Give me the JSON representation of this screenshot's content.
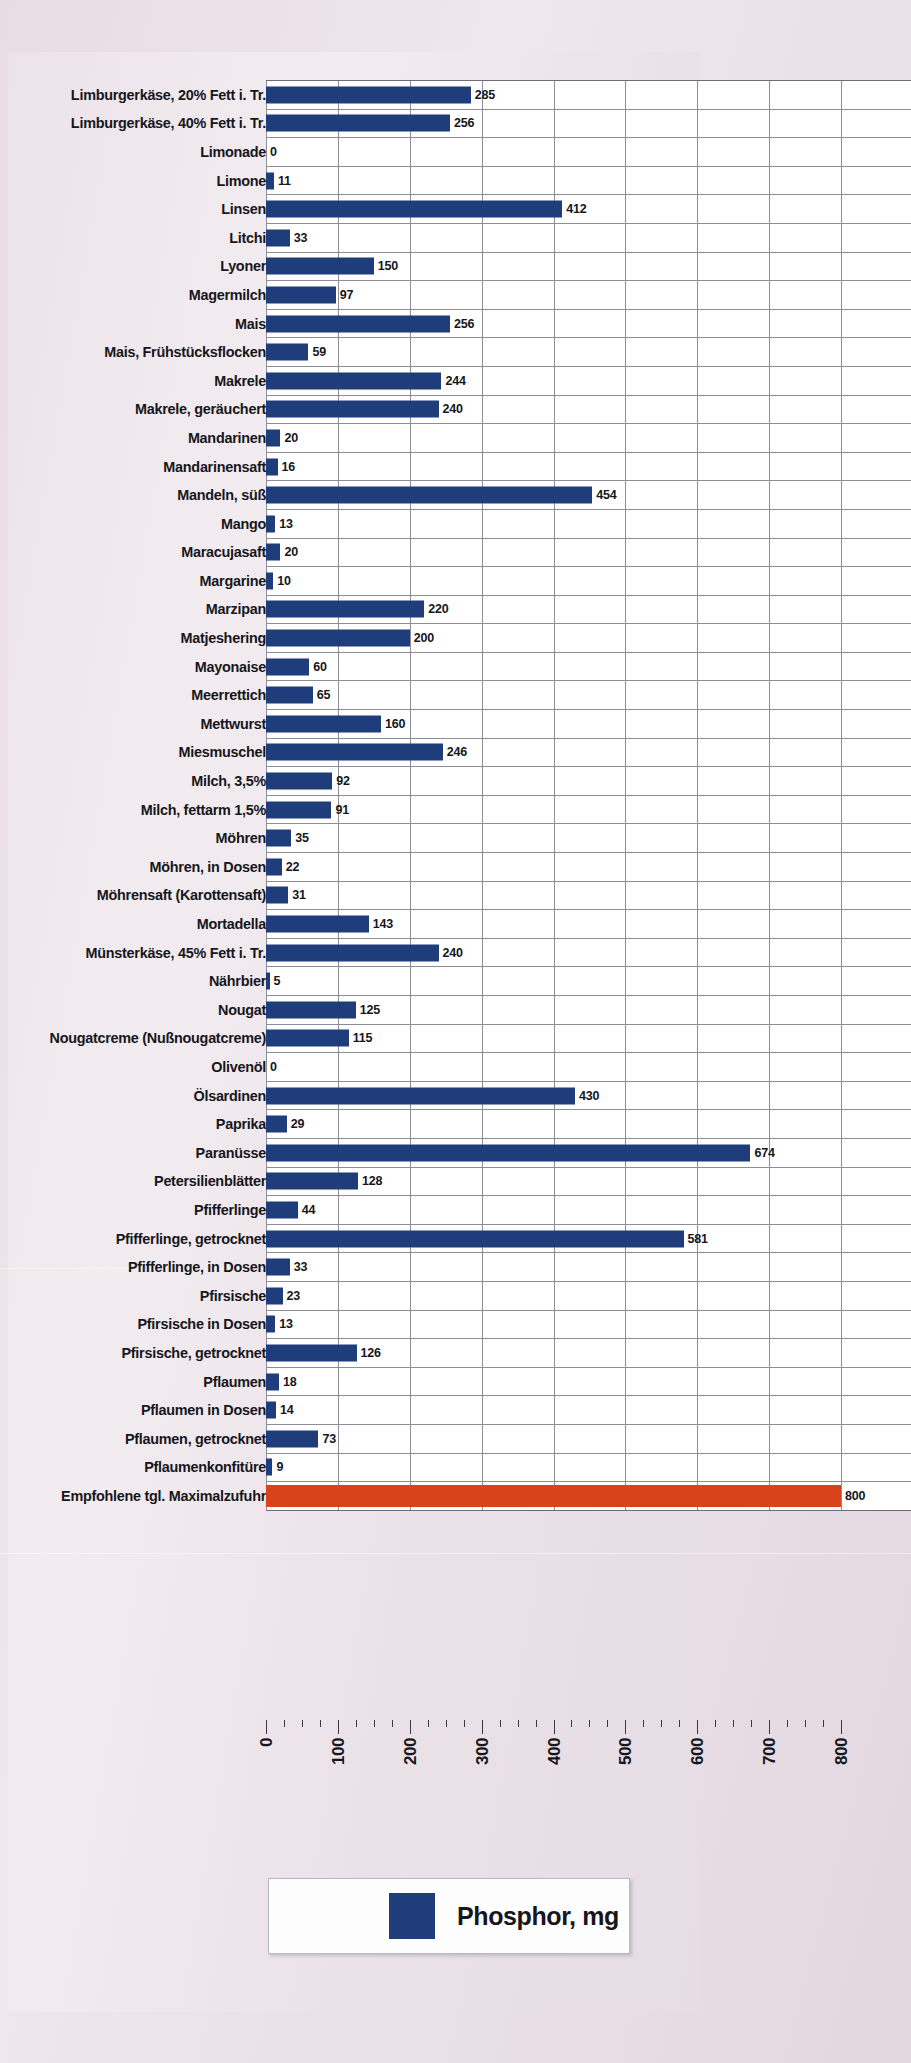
{
  "chart_data": {
    "type": "bar",
    "orientation": "horizontal",
    "title": "",
    "xlabel": "",
    "ylabel": "",
    "xlim": [
      0,
      800
    ],
    "xticks": [
      0,
      100,
      200,
      300,
      400,
      500,
      600,
      700,
      800
    ],
    "minor_tick_step": 25,
    "grid": true,
    "grid_axis": "x",
    "legend": {
      "position": "bottom",
      "entries": [
        {
          "label": "Phosphor, mg",
          "color": "#1f3d7a"
        }
      ]
    },
    "bar_color": "#1f3d7a",
    "reference_bar_color": "#d9431b",
    "categories": [
      "Limburgerkäse, 20% Fett i. Tr.",
      "Limburgerkäse, 40% Fett i. Tr.",
      "Limonade",
      "Limone",
      "Linsen",
      "Litchi",
      "Lyoner",
      "Magermilch",
      "Mais",
      "Mais, Frühstücksflocken",
      "Makrele",
      "Makrele, geräuchert",
      "Mandarinen",
      "Mandarinensaft",
      "Mandeln, süß",
      "Mango",
      "Maracujasaft",
      "Margarine",
      "Marzipan",
      "Matjeshering",
      "Mayonaise",
      "Meerrettich",
      "Mettwurst",
      "Miesmuschel",
      "Milch, 3,5%",
      "Milch, fettarm 1,5%",
      "Möhren",
      "Möhren, in Dosen",
      "Möhrensaft (Karottensaft)",
      "Mortadella",
      "Münsterkäse, 45% Fett i. Tr.",
      "Nährbier",
      "Nougat",
      "Nougatcreme (Nußnougatcreme)",
      "Olivenöl",
      "Ölsardinen",
      "Paprika",
      "Paranüsse",
      "Petersilienblätter",
      "Pfifferlinge",
      "Pfifferlinge, getrocknet",
      "Pfifferlinge, in Dosen",
      "Pfirsische",
      "Pfirsische in Dosen",
      "Pfirsische, getrocknet",
      "Pflaumen",
      "Pflaumen in Dosen",
      "Pflaumen, getrocknet",
      "Pflaumenkonfitüre",
      "Empfohlene tgl. Maximalzufuhr"
    ],
    "values": [
      285,
      256,
      0,
      11,
      412,
      33,
      150,
      97,
      256,
      59,
      244,
      240,
      20,
      16,
      454,
      13,
      20,
      10,
      220,
      200,
      60,
      65,
      160,
      246,
      92,
      91,
      35,
      22,
      31,
      143,
      240,
      5,
      125,
      115,
      0,
      430,
      29,
      674,
      128,
      44,
      581,
      33,
      23,
      13,
      126,
      18,
      14,
      73,
      9,
      800
    ],
    "reference_row_index": 49
  }
}
